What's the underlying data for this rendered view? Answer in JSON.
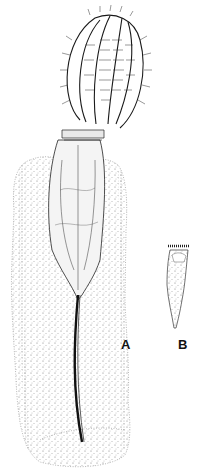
{
  "figure": {
    "labels": [
      {
        "id": "A",
        "text": "A",
        "x": 122,
        "y": 337
      },
      {
        "id": "B",
        "text": "B",
        "x": 178,
        "y": 337
      }
    ],
    "colors": {
      "ink": "#1a1a1a",
      "paper": "#ffffff",
      "stipple": "#555555"
    }
  }
}
